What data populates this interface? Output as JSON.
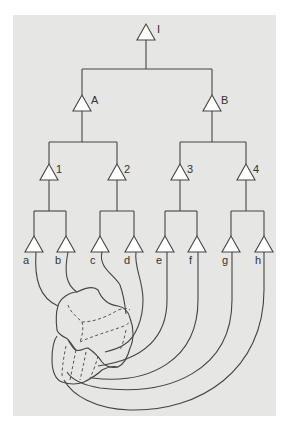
{
  "diagram": {
    "type": "hierarchy-tree",
    "background_color": "#e6e6e4",
    "line_color": "#444444",
    "root": {
      "label": "I"
    },
    "level1": [
      {
        "label": "A"
      },
      {
        "label": "B"
      }
    ],
    "level2": [
      {
        "label": "1"
      },
      {
        "label": "2"
      },
      {
        "label": "3"
      },
      {
        "label": "4"
      }
    ],
    "leaves": [
      {
        "label": "a"
      },
      {
        "label": "b"
      },
      {
        "label": "c"
      },
      {
        "label": "d"
      },
      {
        "label": "e"
      },
      {
        "label": "f"
      },
      {
        "label": "g"
      },
      {
        "label": "h"
      }
    ],
    "blob": {
      "description": "irregular folded region with dashed internal boundaries receiving curves from leaves a–h"
    }
  }
}
